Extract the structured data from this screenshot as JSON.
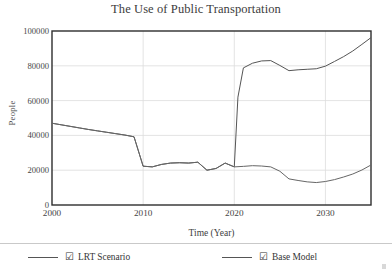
{
  "chart_data": {
    "type": "line",
    "title": "The Use of Public Transportation",
    "xlabel": "Time (Year)",
    "ylabel": "People",
    "xlim": [
      2000,
      2035
    ],
    "ylim": [
      0,
      100000
    ],
    "xticks": [
      "2000",
      "2010",
      "2020",
      "2030"
    ],
    "xtick_values": [
      2000,
      2010,
      2020,
      2030
    ],
    "yticks": [
      "0",
      "20000",
      "40000",
      "60000",
      "80000",
      "100000"
    ],
    "ytick_values": [
      0,
      20000,
      40000,
      60000,
      80000,
      100000
    ],
    "grid": true,
    "legend_position": "bottom",
    "series": [
      {
        "name": "LRT Scenario",
        "checked": true,
        "color": "#555555",
        "x": [
          2000,
          2001,
          2002,
          2003,
          2004,
          2005,
          2006,
          2007,
          2008,
          2009,
          2010,
          2011,
          2012,
          2013,
          2014,
          2015,
          2016,
          2017,
          2018,
          2019,
          2020,
          2020.4,
          2021,
          2022,
          2023,
          2024,
          2025,
          2026,
          2027,
          2028,
          2029,
          2030,
          2031,
          2032,
          2033,
          2034,
          2035
        ],
        "values": [
          47000,
          46100,
          45200,
          44300,
          43400,
          42600,
          41800,
          41000,
          40200,
          39200,
          22300,
          21900,
          23300,
          24100,
          24300,
          24100,
          24600,
          20000,
          21000,
          24100,
          21900,
          62000,
          78800,
          81500,
          82800,
          83000,
          80200,
          77200,
          77700,
          78000,
          78300,
          79800,
          82500,
          85300,
          88500,
          92300,
          96200
        ]
      },
      {
        "name": "Base Model",
        "checked": true,
        "color": "#666666",
        "x": [
          2000,
          2001,
          2002,
          2003,
          2004,
          2005,
          2006,
          2007,
          2008,
          2009,
          2010,
          2011,
          2012,
          2013,
          2014,
          2015,
          2016,
          2017,
          2018,
          2019,
          2020,
          2021,
          2022,
          2023,
          2024,
          2025,
          2026,
          2027,
          2028,
          2029,
          2030,
          2031,
          2032,
          2033,
          2034,
          2035
        ],
        "values": [
          47000,
          46100,
          45200,
          44300,
          43400,
          42600,
          41800,
          41000,
          40200,
          39200,
          22300,
          21900,
          23300,
          24100,
          24300,
          24100,
          24600,
          20000,
          21000,
          24100,
          21900,
          22200,
          22600,
          22400,
          21900,
          19400,
          15000,
          14100,
          13300,
          12900,
          13500,
          14600,
          16100,
          17800,
          20100,
          23000
        ]
      }
    ]
  },
  "legend": {
    "check_glyph": "☑",
    "entries": [
      {
        "label": "LRT Scenario"
      },
      {
        "label": "Base Model"
      }
    ]
  }
}
